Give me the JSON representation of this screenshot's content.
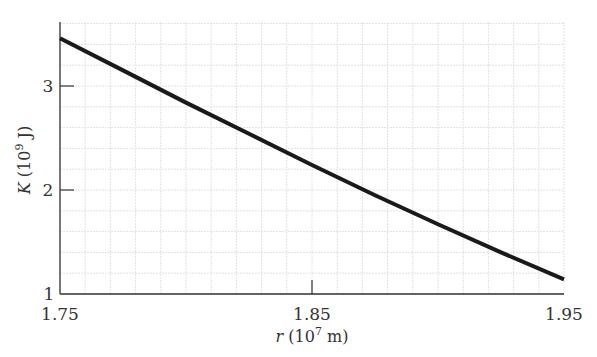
{
  "chart_data": {
    "type": "line",
    "title": "",
    "xlabel": "r (10^7 m)",
    "ylabel": "K (10^9 J)",
    "xlim": [
      1.75,
      1.95
    ],
    "ylim": [
      1,
      3.62
    ],
    "grid": true,
    "legend": null,
    "x_ticks": [
      1.75,
      1.85,
      1.95
    ],
    "x_tick_labels": [
      "1.75",
      "1.85",
      "1.95"
    ],
    "y_ticks": [
      1,
      2,
      3
    ],
    "y_tick_labels": [
      "1",
      "2",
      "3"
    ],
    "series": [
      {
        "name": "K(r)",
        "x": [
          1.75,
          1.775,
          1.8,
          1.825,
          1.85,
          1.875,
          1.9,
          1.925,
          1.95
        ],
        "values": [
          3.46,
          3.15,
          2.84,
          2.54,
          2.24,
          1.95,
          1.67,
          1.4,
          1.14
        ]
      }
    ]
  },
  "labels": {
    "x_axis": {
      "var": "r",
      "unit_open": " (10",
      "exp": "7",
      "unit_close": " m)"
    },
    "y_axis": {
      "var": "K",
      "unit_open": " (10",
      "exp": "9",
      "unit_close": " J)"
    }
  }
}
